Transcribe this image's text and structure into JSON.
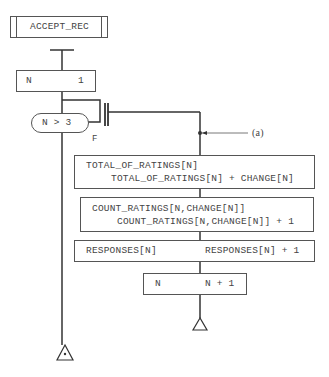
{
  "diagram": {
    "type": "flowchart",
    "colors": {
      "line": "#333333",
      "box_border": "#555555",
      "text": "#444444"
    },
    "module": {
      "label": "ACCEPT_REC"
    },
    "init": {
      "target": "N",
      "value": "1"
    },
    "loop_test": {
      "condition": "N > 3",
      "false_label": "F"
    },
    "annotation": {
      "label": "(a)"
    },
    "steps": [
      {
        "line1": "TOTAL_OF_RATINGS[N]",
        "line2": "TOTAL_OF_RATINGS[N] + CHANGE[N]"
      },
      {
        "line1": "COUNT_RATINGS[N,CHANGE[N]]",
        "line2": "COUNT_RATINGS[N,CHANGE[N]] + 1"
      },
      {
        "target": "RESPONSES[N]",
        "value": "RESPONSES[N] + 1"
      },
      {
        "target": "N",
        "value": "N + 1"
      }
    ]
  }
}
